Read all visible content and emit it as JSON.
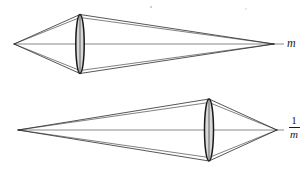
{
  "figure": {
    "background_color": "#ffffff",
    "ray_color": "#2b2b2b",
    "axis_color": "#565656",
    "lens_fill_color": "#d8d8d8",
    "lens_outline_color": "#1a1a1a",
    "width": 307,
    "height": 172
  },
  "labels": {
    "top_label": "m",
    "bottom_numerator": "1",
    "bottom_denominator": "m"
  },
  "diagrams": [
    {
      "id": "top-diagram",
      "name": "magnification-m-diagram",
      "label": "m",
      "axis": {
        "x1": 14,
        "y1": 44,
        "x2": 284,
        "y2": 44
      },
      "lens": {
        "cx": 80,
        "cy": 44,
        "rx": 4.2,
        "ry": 29.5
      },
      "object_vertex": {
        "x": 14,
        "y": 44
      },
      "image_vertex": {
        "x": 274,
        "y": 44
      },
      "lens_top": {
        "x": 80,
        "y": 14.5
      },
      "lens_bottom": {
        "x": 80,
        "y": 73.5
      }
    },
    {
      "id": "bottom-diagram",
      "name": "magnification-inverse-m-diagram",
      "label": "1/m",
      "axis": {
        "x1": 18,
        "y1": 130,
        "x2": 284,
        "y2": 130
      },
      "lens": {
        "cx": 209,
        "cy": 130,
        "rx": 4.5,
        "ry": 31
      },
      "object_vertex": {
        "x": 18,
        "y": 130
      },
      "image_vertex": {
        "x": 277,
        "y": 130
      },
      "lens_top": {
        "x": 209,
        "y": 99
      },
      "lens_bottom": {
        "x": 209,
        "y": 161
      }
    }
  ],
  "artifacts": [
    {
      "name": "scan-speck",
      "x": 151,
      "y": 7,
      "r": 0.9
    },
    {
      "name": "scan-speck",
      "x": 246,
      "y": 9,
      "r": 0.7
    }
  ]
}
